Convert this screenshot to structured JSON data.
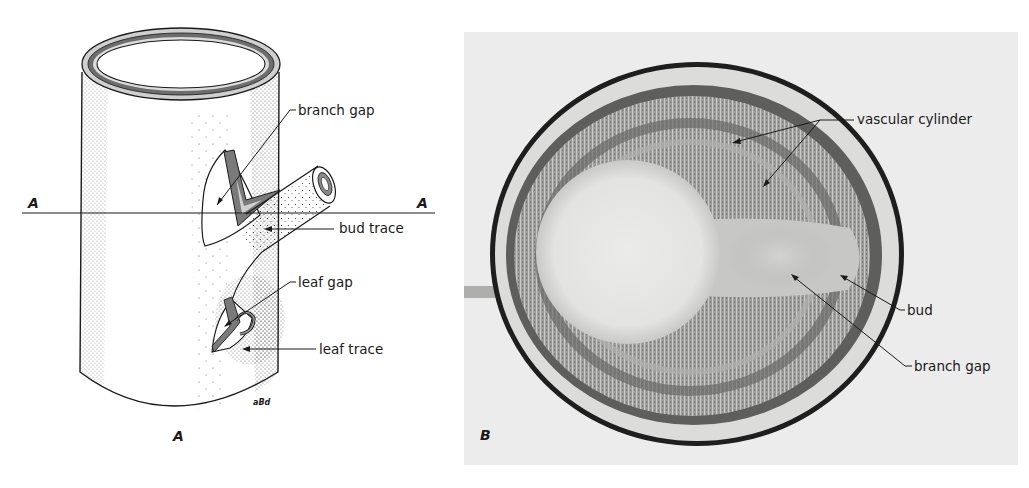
{
  "figure": {
    "panel_a": {
      "panel_letter": "A",
      "section_line_left": "A",
      "section_line_right": "A",
      "artist_signature": "aBd",
      "labels": {
        "branch_gap": "branch gap",
        "bud_trace": "bud trace",
        "leaf_gap": "leaf gap",
        "leaf_trace": "leaf trace"
      }
    },
    "panel_b": {
      "panel_letter": "B",
      "labels": {
        "vascular_cylinder": "vascular cylinder",
        "bud": "bud",
        "branch_gap": "branch gap"
      }
    },
    "colors": {
      "ink": "#1a1a1a",
      "photo_background": "#ececec",
      "pith": "#e6e6e4",
      "vascular_ring_dark": "#6a6a6a",
      "cortex": "#d8d8d6"
    }
  }
}
